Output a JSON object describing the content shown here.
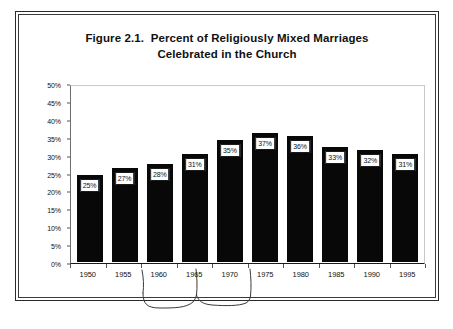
{
  "figure": {
    "title_line1": "Figure 2.1.  Percent of Religiously Mixed Marriages",
    "title_line2": "Celebrated in the Church",
    "border_color": "#2a2a2a",
    "bar_color": "#080808",
    "text_color": "#111111"
  },
  "chart_data": {
    "type": "bar",
    "title": "Figure 2.1.  Percent of Religiously Mixed Marriages Celebrated in the Church",
    "xlabel": "",
    "ylabel": "",
    "categories": [
      "1950",
      "1955",
      "1960",
      "1965",
      "1970",
      "1975",
      "1980",
      "1985",
      "1990",
      "1995"
    ],
    "values": [
      25,
      27,
      28,
      31,
      35,
      37,
      36,
      33,
      32,
      31
    ],
    "value_labels": [
      "25%",
      "27%",
      "28%",
      "31%",
      "35%",
      "37%",
      "36%",
      "33%",
      "32%",
      "31%"
    ],
    "ylim": [
      0,
      50
    ],
    "ytick_values": [
      0,
      5,
      10,
      15,
      20,
      25,
      30,
      35,
      40,
      45,
      50
    ],
    "ytick_labels": [
      "0%",
      "5%",
      "10%",
      "15%",
      "20%",
      "25%",
      "30%",
      "35%",
      "40%",
      "45%",
      "50%"
    ],
    "grid": false,
    "legend": null,
    "series_color": "#080808",
    "annotation": "hand-drawn bracket spanning 1965 to 1975 below the axis"
  }
}
